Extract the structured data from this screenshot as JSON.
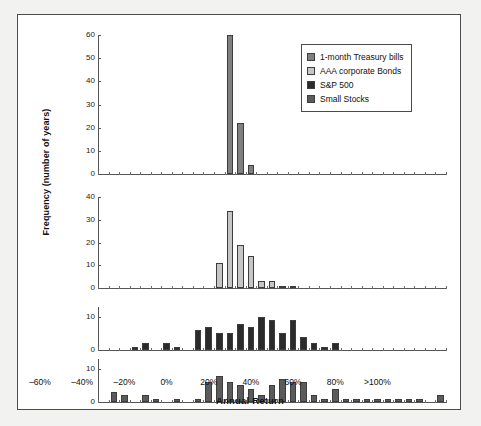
{
  "figure": {
    "x_axis_title": "Annual Return",
    "y_axis_title": "Frequency (number of years)"
  },
  "legend": {
    "items": [
      {
        "label": "1-month Treasury bills",
        "color": "#808080"
      },
      {
        "label": "AAA corporate Bonds",
        "color": "#c6c6c6"
      },
      {
        "label": "S&P 500",
        "color": "#2b2b2b"
      },
      {
        "label": "Small Stocks",
        "color": "#5b5b5b"
      }
    ]
  },
  "x_axis": {
    "tick_labels": [
      "–60%",
      "–40%",
      "–20%",
      "0%",
      "20%",
      "40%",
      "60%",
      "80%",
      ">100%"
    ],
    "tick_values": [
      -60,
      -40,
      -20,
      0,
      20,
      40,
      60,
      80,
      100
    ],
    "bin_width": 5,
    "bin_start": -60,
    "bin_count": 33
  },
  "chart_data": {
    "type": "bar",
    "title": "",
    "subtitle": "",
    "xlabel": "Annual Return",
    "ylabel": "Frequency (number of years)",
    "grid": false,
    "legend_position": "top-right",
    "layout": "4 stacked histogram panels sharing one x axis",
    "bin_edges_percent": [
      -60,
      -55,
      -50,
      -45,
      -40,
      -35,
      -30,
      -25,
      -20,
      -15,
      -10,
      -5,
      0,
      5,
      10,
      15,
      20,
      25,
      30,
      35,
      40,
      45,
      50,
      55,
      60,
      65,
      70,
      75,
      80,
      85,
      90,
      95,
      100
    ],
    "panels": [
      {
        "name": "1-month Treasury bills",
        "color": "#808080",
        "ylim": [
          0,
          60
        ],
        "yticks": [
          0,
          10,
          20,
          30,
          40,
          50,
          60
        ],
        "bins_percent": [
          -60,
          -55,
          -50,
          -45,
          -40,
          -35,
          -30,
          -25,
          -20,
          -15,
          -10,
          -5,
          0,
          5,
          10,
          15,
          20,
          25,
          30,
          35,
          40,
          45,
          50,
          55,
          60,
          65,
          70,
          75,
          80,
          85,
          90,
          95,
          100
        ],
        "values": [
          0,
          0,
          0,
          0,
          0,
          0,
          0,
          0,
          0,
          0,
          0,
          0,
          60,
          22,
          4,
          0,
          0,
          0,
          0,
          0,
          0,
          0,
          0,
          0,
          0,
          0,
          0,
          0,
          0,
          0,
          0,
          0,
          0
        ]
      },
      {
        "name": "AAA corporate Bonds",
        "color": "#c6c6c6",
        "ylim": [
          0,
          40
        ],
        "yticks": [
          0,
          10,
          20,
          30,
          40
        ],
        "bins_percent": [
          -60,
          -55,
          -50,
          -45,
          -40,
          -35,
          -30,
          -25,
          -20,
          -15,
          -10,
          -5,
          0,
          5,
          10,
          15,
          20,
          25,
          30,
          35,
          40,
          45,
          50,
          55,
          60,
          65,
          70,
          75,
          80,
          85,
          90,
          95,
          100
        ],
        "values": [
          0,
          0,
          0,
          0,
          0,
          0,
          0,
          0,
          0,
          0,
          0,
          11,
          34,
          19,
          14,
          3,
          3,
          1,
          1,
          0,
          0,
          0,
          0,
          0,
          0,
          0,
          0,
          0,
          0,
          0,
          0,
          0,
          0
        ]
      },
      {
        "name": "S&P 500",
        "color": "#2b2b2b",
        "ylim": [
          0,
          13
        ],
        "yticks": [
          0,
          10
        ],
        "bins_percent": [
          -60,
          -55,
          -50,
          -45,
          -40,
          -35,
          -30,
          -25,
          -20,
          -15,
          -10,
          -5,
          0,
          5,
          10,
          15,
          20,
          25,
          30,
          35,
          40,
          45,
          50,
          55,
          60,
          65,
          70,
          75,
          80,
          85,
          90,
          95,
          100
        ],
        "values": [
          0,
          0,
          0,
          1,
          2,
          0,
          2,
          1,
          0,
          6,
          7,
          5,
          5,
          8,
          7,
          10,
          9,
          5,
          9,
          4,
          2,
          1,
          2,
          0,
          0,
          0,
          0,
          0,
          0,
          0,
          0,
          0,
          0
        ]
      },
      {
        "name": "Small Stocks",
        "color": "#5b5b5b",
        "ylim": [
          0,
          13
        ],
        "yticks": [
          0,
          10
        ],
        "bins_percent": [
          -60,
          -55,
          -50,
          -45,
          -40,
          -35,
          -30,
          -25,
          -20,
          -15,
          -10,
          -5,
          0,
          5,
          10,
          15,
          20,
          25,
          30,
          35,
          40,
          45,
          50,
          55,
          60,
          65,
          70,
          75,
          80,
          85,
          90,
          95,
          100
        ],
        "values": [
          0,
          3,
          2,
          0,
          2,
          1,
          0,
          1,
          0,
          1,
          6,
          8,
          6,
          5,
          4,
          2,
          5,
          7,
          6,
          6,
          2,
          1,
          4,
          1,
          1,
          1,
          1,
          1,
          1,
          1,
          1,
          0,
          2
        ]
      }
    ]
  }
}
